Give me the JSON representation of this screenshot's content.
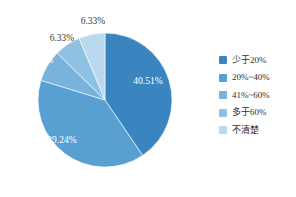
{
  "chart_data": {
    "type": "pie",
    "title": "",
    "subtitle": "",
    "xlabel": "",
    "ylabel": "",
    "legend_position": "right",
    "grid": false,
    "start_angle_deg": 0,
    "direction": "clockwise",
    "categories": [
      "少于20%",
      "20%~40%",
      "41%~60%",
      "多于60%",
      "不清楚"
    ],
    "values": [
      40.51,
      39.24,
      7.59,
      6.33,
      6.33
    ],
    "value_labels": [
      "40.51%",
      "39.24%",
      "7.59%",
      "6.33%",
      "6.33%"
    ],
    "colors": [
      "#3a85c0",
      "#59a0d2",
      "#77b3dc",
      "#8fc1e3",
      "#bad8ee"
    ],
    "label_text_colors": [
      "#ffffff",
      "#ffffff",
      "#ffffff",
      "#3a3a3a",
      "#3a3a3a"
    ]
  },
  "legend": {
    "items": [
      {
        "label": "少于20%",
        "color": "#3a85c0"
      },
      {
        "label": "20%~40%",
        "color": "#59a0d2"
      },
      {
        "label": "41%~60%",
        "color": "#77b3dc"
      },
      {
        "label": "多于60%",
        "color": "#8fc1e3"
      },
      {
        "label": "不清楚",
        "color": "#bad8ee"
      }
    ]
  },
  "slice_labels": [
    {
      "text": "40.51%",
      "x": 148,
      "y": 84,
      "anchor": "middle",
      "style": "inside"
    },
    {
      "text": "39.24%",
      "x": 62,
      "y": 143,
      "anchor": "middle",
      "style": "inside"
    },
    {
      "text": "7.59%",
      "x": 41,
      "y": 63,
      "anchor": "middle",
      "style": "inside"
    },
    {
      "text": "6.33%",
      "x": 62,
      "y": 41,
      "anchor": "middle",
      "style": "outside"
    },
    {
      "text": "6.33%",
      "x": 93,
      "y": 24,
      "anchor": "middle",
      "style": "outside"
    }
  ],
  "geometry": {
    "center_x": 105,
    "center_y": 100,
    "radius": 67
  }
}
